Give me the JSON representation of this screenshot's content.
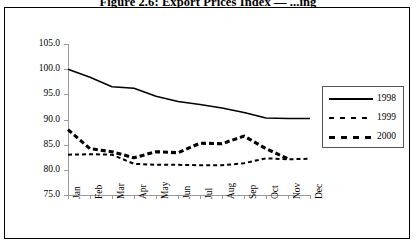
{
  "figure": {
    "title": "Figure 2.6: Export Prices Index — ...ing"
  },
  "chart_data": {
    "type": "line",
    "title": "Figure 2.6: Export Prices Index — ...ing",
    "xlabel": "",
    "ylabel": "",
    "categories": [
      "Jan",
      "Feb",
      "Mar",
      "Apr",
      "May",
      "Jun",
      "Jul",
      "Aug",
      "Sep",
      "Oct",
      "Nov",
      "Dec"
    ],
    "ylim": [
      75.0,
      105.0
    ],
    "yticks": [
      "105.0",
      "100.0",
      "95.0",
      "90.0",
      "85.0",
      "80.0",
      "75.0"
    ],
    "ytick_values": [
      105.0,
      100.0,
      95.0,
      90.0,
      85.0,
      80.0,
      75.0
    ],
    "grid": false,
    "legend_position": "right",
    "series": [
      {
        "name": "1998",
        "style": "solid",
        "values": [
          100.0,
          98.4,
          96.5,
          96.2,
          94.6,
          93.6,
          93.0,
          92.3,
          91.4,
          90.3,
          90.2,
          90.2
        ]
      },
      {
        "name": "1999",
        "style": "dashed",
        "values": [
          83.0,
          83.1,
          83.0,
          81.2,
          81.0,
          81.0,
          80.9,
          80.9,
          81.3,
          82.3,
          82.1,
          82.2
        ]
      },
      {
        "name": "2000",
        "style": "dashed-thick",
        "values": [
          88.0,
          84.2,
          83.6,
          82.4,
          83.6,
          83.4,
          85.3,
          85.2,
          86.7,
          84.2,
          82.2,
          null
        ]
      }
    ]
  },
  "legend": {
    "entries": [
      {
        "label": "1998"
      },
      {
        "label": "1999"
      },
      {
        "label": "2000"
      }
    ]
  },
  "colors": {
    "line": "#000000",
    "axis": "#9a9a9a",
    "border": "#000000",
    "background": "#ffffff"
  }
}
